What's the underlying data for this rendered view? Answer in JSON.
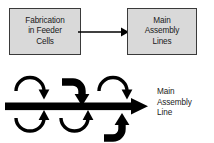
{
  "diagram": {
    "colors": {
      "box_fill": "#d9d9d9",
      "box_stroke": "#3a3a3a",
      "arrow": "#000000",
      "text": "#1a1a1a",
      "background": "#ffffff"
    },
    "top_row": {
      "source_box": {
        "label": "Fabrication\nin Feeder\nCells"
      },
      "connector": {
        "name": "feeder-to-assembly-arrow",
        "direction": "left-to-right"
      },
      "target_box": {
        "label": "Main\nAssembly\nLines"
      }
    },
    "bottom_row": {
      "main_line_caption": "Main\nAssembly\nLine",
      "main_line": {
        "name": "main-assembly-line-arrow",
        "direction": "left-to-right"
      },
      "feeder_arrows_top": [
        {
          "name": "feeder-arc-top-1",
          "shape": "arc-over-down"
        },
        {
          "name": "feeder-elbow-top-2",
          "shape": "elbow-down-thick"
        },
        {
          "name": "feeder-arc-top-3",
          "shape": "arc-over-down"
        }
      ],
      "feeder_arrows_bottom": [
        {
          "name": "feeder-arc-bottom-1",
          "shape": "arc-under-up"
        },
        {
          "name": "feeder-arc-bottom-2",
          "shape": "arc-under-up"
        },
        {
          "name": "feeder-elbow-bottom-3",
          "shape": "elbow-up-thick"
        }
      ]
    }
  }
}
